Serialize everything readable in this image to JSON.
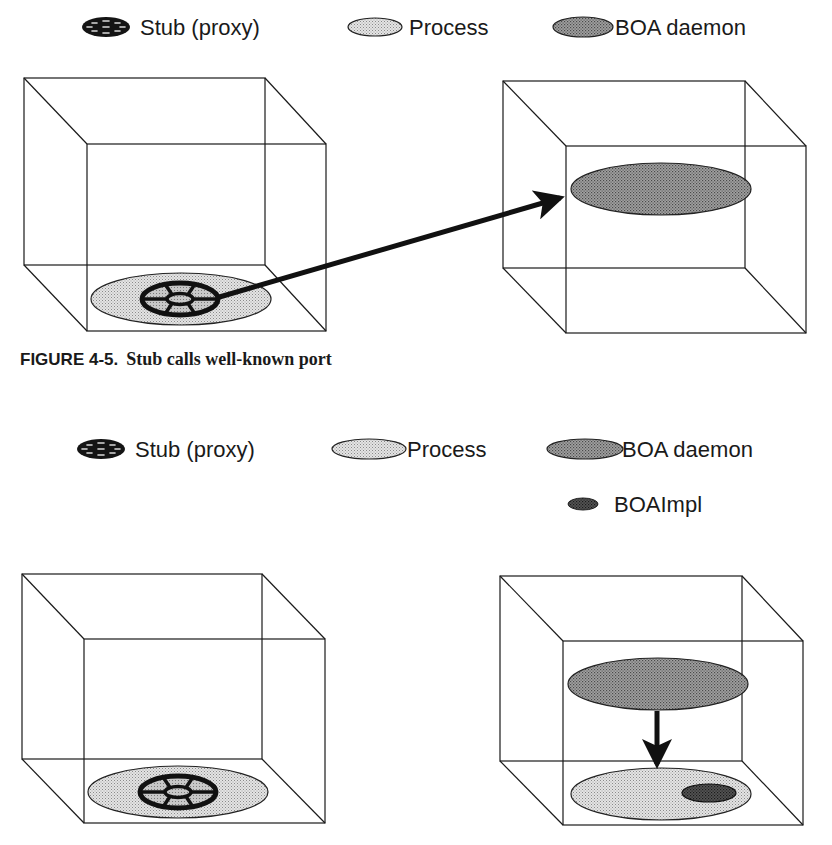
{
  "figure_top": {
    "legend": [
      {
        "key": "stub",
        "label": "Stub (proxy)",
        "icon": "stub-wheel-icon"
      },
      {
        "key": "process",
        "label": "Process",
        "icon": "process-ellipse-icon"
      },
      {
        "key": "daemon",
        "label": "BOA daemon",
        "icon": "daemon-ellipse-icon"
      }
    ],
    "caption": {
      "number": "FIGURE 4-5.",
      "title": "Stub calls well-known port"
    },
    "left_box": {
      "contents": [
        "Process",
        "Stub (proxy)"
      ]
    },
    "right_box": {
      "contents": [
        "BOA daemon"
      ]
    },
    "arrow": {
      "from": "Stub (proxy)",
      "to": "BOA daemon"
    }
  },
  "figure_bottom": {
    "legend": [
      {
        "key": "stub",
        "label": "Stub (proxy)",
        "icon": "stub-wheel-icon"
      },
      {
        "key": "process",
        "label": "Process",
        "icon": "process-ellipse-icon"
      },
      {
        "key": "daemon",
        "label": "BOA daemon",
        "icon": "daemon-ellipse-icon"
      },
      {
        "key": "impl",
        "label": "BOAImpl",
        "icon": "impl-ellipse-icon"
      }
    ],
    "left_box": {
      "contents": [
        "Process",
        "Stub (proxy)"
      ]
    },
    "right_box": {
      "contents": [
        "BOA daemon",
        "Process",
        "BOAImpl"
      ]
    },
    "arrow": {
      "from": "BOA daemon",
      "to": "Process"
    }
  },
  "colors": {
    "line": "#1a1a1a",
    "process_fill": "#d4d4d4",
    "daemon_fill": "#8c8c8c",
    "impl_fill": "#3a3a3a",
    "stub_fill": "#1a1a1a",
    "background": "#ffffff"
  }
}
